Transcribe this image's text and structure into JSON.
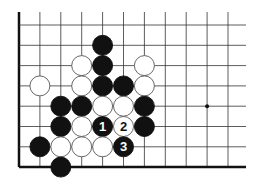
{
  "board": {
    "columns": 11,
    "rows": 8,
    "origin_x": 19,
    "origin_y": 25,
    "spacing_x": 20.9,
    "spacing_y": 20.3,
    "right_end_x": 246,
    "top_end_y": 12,
    "edges": [
      "left",
      "bottom"
    ],
    "star_points": [
      {
        "col": 9,
        "row": 4
      }
    ],
    "colors": {
      "line": "#333333",
      "edge": "#111111",
      "black": "#111111",
      "white": "#ffffff"
    }
  },
  "stones": [
    {
      "color": "black",
      "col": 4,
      "row": 1
    },
    {
      "color": "white",
      "col": 3,
      "row": 2
    },
    {
      "color": "black",
      "col": 4,
      "row": 2
    },
    {
      "color": "white",
      "col": 6,
      "row": 2
    },
    {
      "color": "white",
      "col": 1,
      "row": 3
    },
    {
      "color": "white",
      "col": 3,
      "row": 3
    },
    {
      "color": "black",
      "col": 4,
      "row": 3
    },
    {
      "color": "black",
      "col": 5,
      "row": 3
    },
    {
      "color": "white",
      "col": 6,
      "row": 3
    },
    {
      "color": "black",
      "col": 2,
      "row": 4
    },
    {
      "color": "black",
      "col": 3,
      "row": 4
    },
    {
      "color": "white",
      "col": 4,
      "row": 4
    },
    {
      "color": "white",
      "col": 5,
      "row": 4
    },
    {
      "color": "black",
      "col": 6,
      "row": 4
    },
    {
      "color": "black",
      "col": 2,
      "row": 5
    },
    {
      "color": "white",
      "col": 3,
      "row": 5
    },
    {
      "color": "black",
      "col": 4,
      "row": 5,
      "label": "1"
    },
    {
      "color": "white",
      "col": 5,
      "row": 5,
      "label": "2"
    },
    {
      "color": "black",
      "col": 6,
      "row": 5
    },
    {
      "color": "black",
      "col": 1,
      "row": 6
    },
    {
      "color": "white",
      "col": 2,
      "row": 6
    },
    {
      "color": "white",
      "col": 3,
      "row": 6
    },
    {
      "color": "white",
      "col": 4,
      "row": 6
    },
    {
      "color": "black",
      "col": 5,
      "row": 6,
      "label": "3"
    },
    {
      "color": "black",
      "col": 2,
      "row": 7
    }
  ]
}
